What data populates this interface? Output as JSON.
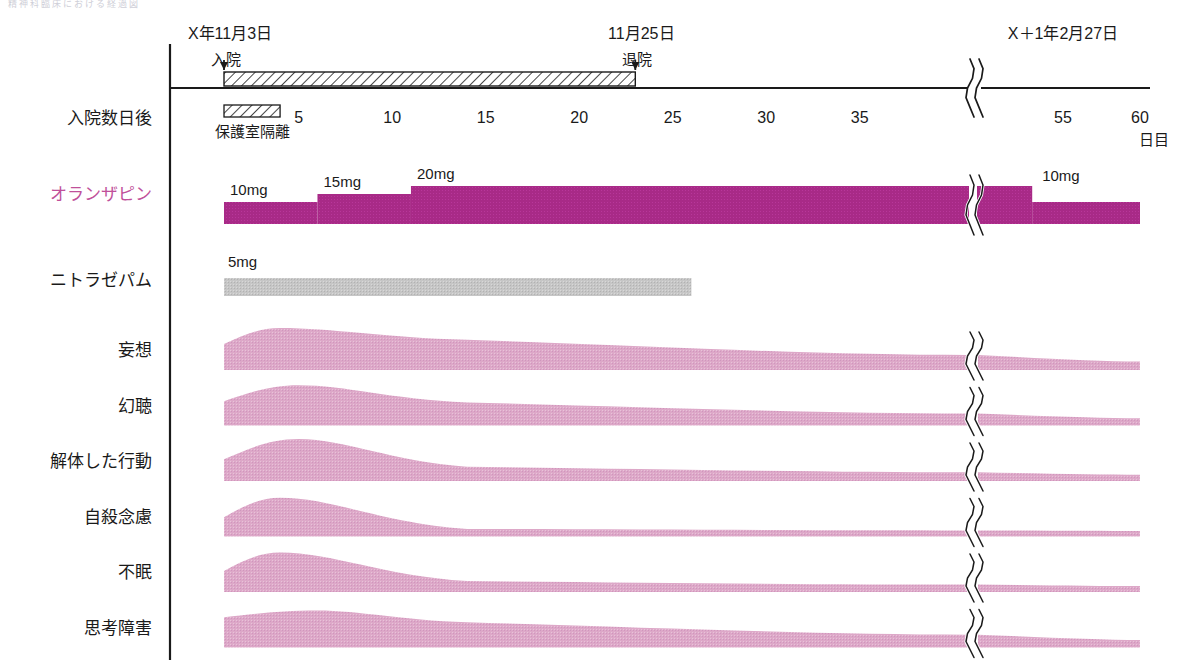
{
  "figure": {
    "faded_header": "精神科臨床における経過図",
    "axis_unit": "日目",
    "row_axis_label": "入院数日後"
  },
  "dates": {
    "admission_date": "X年11月3日",
    "admission_event": "入院",
    "discharge_date": "11月25日",
    "discharge_event": "退院",
    "followup_date": "X＋1年2月27日"
  },
  "axis": {
    "ticks": [
      {
        "label": "5",
        "day": 5
      },
      {
        "label": "10",
        "day": 10
      },
      {
        "label": "15",
        "day": 15
      },
      {
        "label": "20",
        "day": 20
      },
      {
        "label": "25",
        "day": 25
      },
      {
        "label": "30",
        "day": 30
      },
      {
        "label": "35",
        "day": 35
      },
      {
        "label": "55",
        "day": 55
      },
      {
        "label": "60",
        "day": 60
      }
    ],
    "break_after_day": 38,
    "break_resume_day": 52
  },
  "bars": {
    "hospitalization": {
      "start_day": 1,
      "end_day": 23,
      "pattern": "diagonal-hatch"
    },
    "seclusion": {
      "label": "保護室隔離",
      "start_day": 1,
      "end_day": 4,
      "pattern": "diagonal-hatch"
    }
  },
  "drugs": [
    {
      "name": "オランザピン",
      "accent": "#a82a87",
      "steps": [
        {
          "dose_label": "10mg",
          "start_day": 1,
          "end_day": 6
        },
        {
          "dose_label": "15mg",
          "start_day": 6,
          "end_day": 11
        },
        {
          "dose_label": "20mg",
          "start_day": 11,
          "end_day": 53
        },
        {
          "dose_label": "10mg",
          "start_day": 53,
          "end_day": 60
        }
      ]
    },
    {
      "name": "ニトラゼパム",
      "accent": "#b9b9b9",
      "steps": [
        {
          "dose_label": "5mg",
          "start_day": 1,
          "end_day": 26
        }
      ]
    }
  ],
  "symptoms": [
    {
      "name": "妄想",
      "onset_severity": 0.62,
      "peak_severity": 1.0,
      "peak_day": 4,
      "mid_severity": 0.72,
      "end_severity": 0.2
    },
    {
      "name": "幻聴",
      "onset_severity": 0.58,
      "peak_severity": 0.96,
      "peak_day": 5,
      "mid_severity": 0.55,
      "end_severity": 0.17
    },
    {
      "name": "解体した行動",
      "onset_severity": 0.52,
      "peak_severity": 1.0,
      "peak_day": 5,
      "mid_severity": 0.34,
      "end_severity": 0.15
    },
    {
      "name": "自殺念慮",
      "onset_severity": 0.46,
      "peak_severity": 0.92,
      "peak_day": 4,
      "mid_severity": 0.18,
      "end_severity": 0.13
    },
    {
      "name": "不眠",
      "onset_severity": 0.5,
      "peak_severity": 0.94,
      "peak_day": 4,
      "mid_severity": 0.26,
      "end_severity": 0.14
    },
    {
      "name": "思考障害",
      "onset_severity": 0.72,
      "peak_severity": 0.88,
      "peak_day": 6,
      "mid_severity": 0.6,
      "end_severity": 0.18
    }
  ],
  "colors": {
    "drug_magenta": "#a82a87",
    "symptom_pink": "#dda8c8",
    "nitrazepam_gray": "#c2c2c2",
    "axis_black": "#1a1a1a",
    "label_accent": "#c0509a"
  }
}
